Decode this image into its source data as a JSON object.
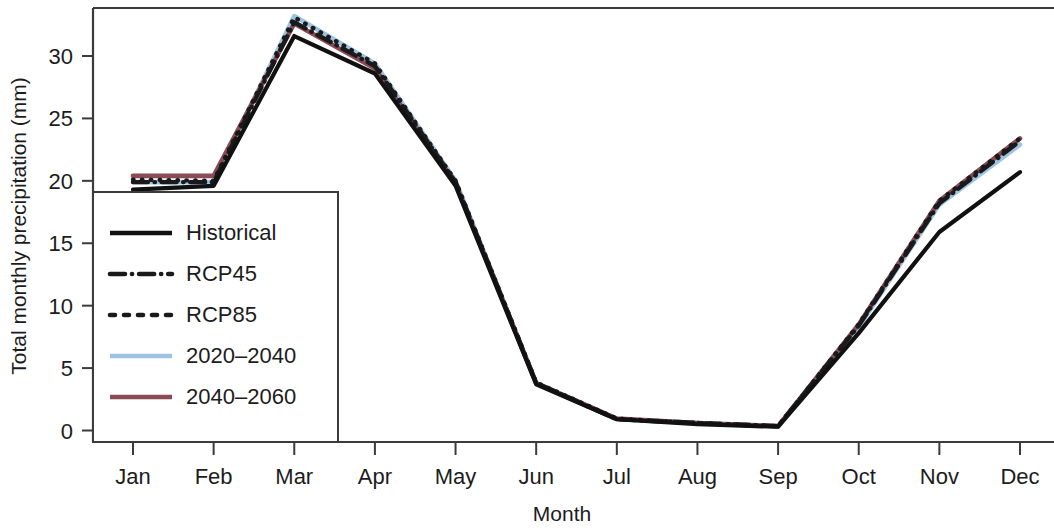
{
  "chart_data": {
    "type": "line",
    "title": "",
    "xlabel": "Month",
    "ylabel": "Total monthly precipitation (mm)",
    "categories": [
      "Jan",
      "Feb",
      "Mar",
      "Apr",
      "May",
      "Jun",
      "Jul",
      "Aug",
      "Sep",
      "Oct",
      "Nov",
      "Dec"
    ],
    "xtick_labels": [
      "Jan",
      "Feb",
      "Mar",
      "Apr",
      "May",
      "Jun",
      "Jul",
      "Aug",
      "Sep",
      "Oct",
      "Nov",
      "Dec"
    ],
    "ytick_labels": [
      "0",
      "5",
      "10",
      "15",
      "20",
      "25",
      "30"
    ],
    "ytick_values": [
      0,
      5,
      10,
      15,
      20,
      25,
      30
    ],
    "ylim": [
      -1.2,
      34.5
    ],
    "grid": false,
    "legend_position": "lower-left-inside",
    "series": [
      {
        "name": "Historical",
        "style": "solid",
        "color": "#111111",
        "values": [
          19.3,
          19.6,
          31.6,
          28.6,
          19.6,
          3.7,
          0.9,
          0.5,
          0.3,
          7.8,
          15.9,
          20.7
        ]
      },
      {
        "name": "RCP45",
        "style": "dashdot",
        "color": "#1a1a1a",
        "values": [
          19.9,
          19.9,
          32.7,
          29.2,
          19.9,
          3.8,
          0.9,
          0.6,
          0.35,
          8.4,
          18.2,
          23.2
        ]
      },
      {
        "name": "RCP85",
        "style": "dotted",
        "color": "#1a1a1a",
        "values": [
          20.1,
          20.0,
          33.1,
          29.4,
          20.0,
          3.85,
          0.95,
          0.6,
          0.35,
          8.5,
          18.4,
          23.4
        ]
      },
      {
        "name": "2020–2040",
        "style": "solid",
        "color": "#9ec4e4",
        "values": [
          19.9,
          19.9,
          33.2,
          29.4,
          20.0,
          3.8,
          0.9,
          0.6,
          0.3,
          8.3,
          18.1,
          22.9
        ]
      },
      {
        "name": "2040–2060",
        "style": "solid",
        "color": "#8a4a56",
        "values": [
          20.4,
          20.4,
          32.6,
          29.0,
          19.8,
          3.8,
          0.95,
          0.6,
          0.35,
          8.5,
          18.4,
          23.4
        ]
      }
    ]
  },
  "legend": {
    "entries": [
      {
        "label": "Historical",
        "swatch": "solid-black"
      },
      {
        "label": "RCP45",
        "swatch": "dashdot-black"
      },
      {
        "label": "RCP85",
        "swatch": "dotted-black"
      },
      {
        "label": "2020–2040",
        "swatch": "solid-blue"
      },
      {
        "label": "2040–2060",
        "swatch": "solid-red"
      }
    ]
  },
  "colors": {
    "historical": "#111111",
    "rcp45": "#1a1a1a",
    "rcp85": "#1a1a1a",
    "period_2020_2040": "#9ec4e4",
    "period_2040_2060": "#8a4a56",
    "axis": "#3b3b3b",
    "text": "#1c1c1c",
    "background": "#ffffff"
  }
}
